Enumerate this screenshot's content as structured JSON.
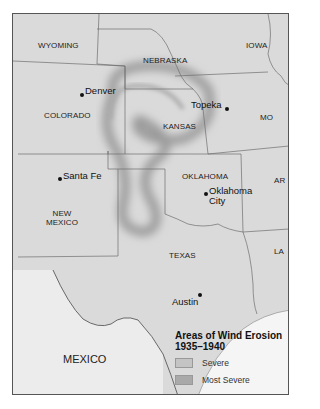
{
  "map": {
    "title": "Areas of Wind Erosion",
    "years": "1935–1940",
    "states": [
      {
        "name": "WYOMING"
      },
      {
        "name": "NEBRASKA"
      },
      {
        "name": "IOWA"
      },
      {
        "name": "COLORADO"
      },
      {
        "name": "KANSAS"
      },
      {
        "name": "MO"
      },
      {
        "name": "OKLAHOMA"
      },
      {
        "name": "AR"
      },
      {
        "name": "NEW MEXICO"
      },
      {
        "name": "TEXAS"
      },
      {
        "name": "LA"
      }
    ],
    "country": "MEXICO",
    "cities": [
      {
        "name": "Denver"
      },
      {
        "name": "Topeka"
      },
      {
        "name": "Santa Fe"
      },
      {
        "name": "Oklahoma City"
      },
      {
        "name": "Austin"
      }
    ],
    "legend": {
      "title": "Areas of Wind Erosion",
      "subtitle": "1935–1940",
      "items": [
        {
          "label": "Severe",
          "color": "#c4c4c4"
        },
        {
          "label": "Most Severe",
          "color": "#a9a9a9"
        }
      ]
    },
    "colors": {
      "land": "#d9d9d9",
      "water": "#f4f4f4",
      "border": "#6e6e6e",
      "erosion": "#9a9a9a"
    }
  }
}
